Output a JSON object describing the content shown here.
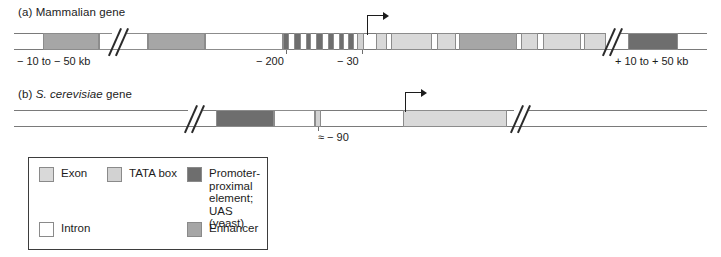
{
  "figure": {
    "panels": [
      {
        "id": "a",
        "prefix": "(a)",
        "title": "Mammalian gene",
        "title_italic": ""
      },
      {
        "id": "b",
        "prefix": "(b)",
        "title": "gene",
        "title_italic": "S. cerevisiae"
      }
    ]
  },
  "colors": {
    "exon": "#d9d9d9",
    "tata": "#d2d2d2",
    "promoter_proximal": "#6e6e6e",
    "intron": "#ffffff",
    "enhancer": "#a6a6a6",
    "line": "#7a7a7a",
    "ink": "#1c1c1c",
    "legend_border": "#3d3d3d"
  },
  "mammalian": {
    "labels": {
      "left": "− 10 to  − 50 kb",
      "minus200": "− 200",
      "minus30": "− 30",
      "right": "+ 10 to  + 50 kb"
    },
    "segments": [
      {
        "name": "enhancer",
        "type": "enhancer",
        "x": 43,
        "w": 56
      },
      {
        "name": "intron-spacer-1",
        "type": "intron",
        "x": 99,
        "w": 49
      },
      {
        "name": "enhancer",
        "type": "enhancer",
        "x": 148,
        "w": 57
      },
      {
        "name": "intron-spacer-2",
        "type": "intron",
        "x": 205,
        "w": 78
      },
      {
        "name": "promoter-proximal",
        "type": "ppe",
        "x": 283,
        "w": 6
      },
      {
        "name": "promoter-proximal",
        "type": "ppe",
        "x": 294,
        "w": 7
      },
      {
        "name": "promoter-proximal",
        "type": "ppe",
        "x": 306,
        "w": 5
      },
      {
        "name": "promoter-proximal",
        "type": "ppe",
        "x": 316,
        "w": 7
      },
      {
        "name": "promoter-proximal",
        "type": "ppe",
        "x": 328,
        "w": 6
      },
      {
        "name": "promoter-proximal",
        "type": "ppe",
        "x": 339,
        "w": 5
      },
      {
        "name": "promoter-proximal",
        "type": "ppe",
        "x": 348,
        "w": 6
      },
      {
        "name": "tata-box",
        "type": "tata",
        "x": 357,
        "w": 7
      },
      {
        "name": "exon-1",
        "type": "exon",
        "x": 376,
        "w": 11
      },
      {
        "name": "exon-2",
        "type": "exon",
        "x": 391,
        "w": 41
      },
      {
        "name": "exon-3",
        "type": "exon",
        "x": 437,
        "w": 19
      },
      {
        "name": "enhancer",
        "type": "enhancer",
        "x": 459,
        "w": 58
      },
      {
        "name": "exon-4",
        "type": "exon",
        "x": 521,
        "w": 17
      },
      {
        "name": "exon-5",
        "type": "exon",
        "x": 543,
        "w": 38
      },
      {
        "name": "exon-6",
        "type": "exon",
        "x": 584,
        "w": 22
      },
      {
        "name": "promoter-proximal",
        "type": "ppe",
        "x": 628,
        "w": 50
      }
    ],
    "breaks": [
      {
        "x": 110
      },
      {
        "x": 604
      }
    ],
    "tss": {
      "x": 367
    }
  },
  "yeast": {
    "labels": {
      "minus90": "≈ − 90"
    },
    "segments": [
      {
        "name": "uas",
        "type": "ppe",
        "x": 216,
        "w": 58
      },
      {
        "name": "spacer",
        "type": "intron",
        "x": 274,
        "w": 41
      },
      {
        "name": "tata-box",
        "type": "tata",
        "x": 315,
        "w": 6
      },
      {
        "name": "exon",
        "type": "exon",
        "x": 403,
        "w": 104
      }
    ],
    "breaks": [
      {
        "x": 186
      },
      {
        "x": 512
      }
    ],
    "tss": {
      "x": 405
    }
  },
  "legend": {
    "items": [
      {
        "name": "exon",
        "type": "exon",
        "label": "Exon"
      },
      {
        "name": "tata-box",
        "type": "tata",
        "label": "TATA box"
      },
      {
        "name": "promoter-proximal",
        "type": "ppe",
        "label": "Promoter-\nproximal\nelement;\nUAS (yeast)"
      },
      {
        "name": "intron",
        "type": "intron",
        "label": "Intron"
      },
      {
        "name": "enhancer",
        "type": "enhancer",
        "label": "Enhancer"
      }
    ]
  }
}
